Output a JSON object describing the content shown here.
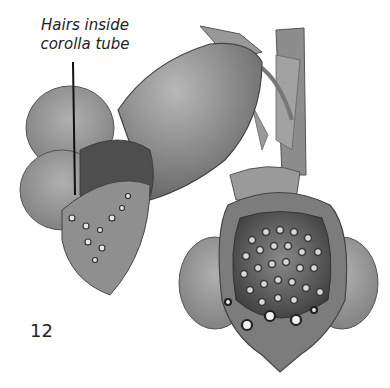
{
  "figure": {
    "annotation": {
      "line1": "Hairs inside",
      "line2": "corolla tube"
    },
    "figure_number": "12",
    "colors": {
      "background": "#ffffff",
      "ink": "#222222",
      "petal_light": "#a8a8a8",
      "petal_mid": "#8a8a8a",
      "throat_dark": "#4a4a4a",
      "spot_light": "#e6e6e6"
    }
  }
}
